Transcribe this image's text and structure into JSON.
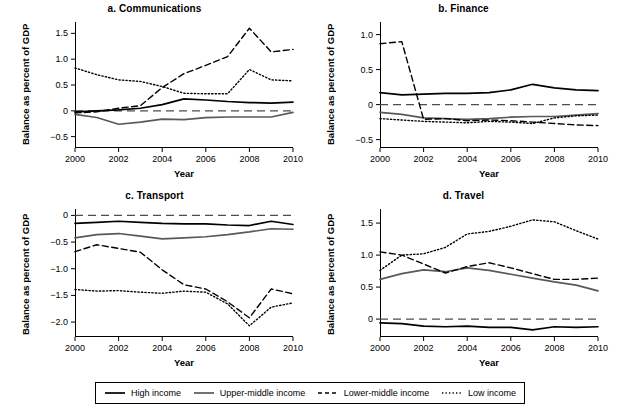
{
  "figure": {
    "axis_x_label": "Year",
    "axis_y_label": "Balance as percent of GDP"
  },
  "legend": {
    "items": [
      {
        "label": "High income",
        "style": "solid",
        "color": "#000000"
      },
      {
        "label": "Upper-middle income",
        "style": "solid",
        "color": "#595959"
      },
      {
        "label": "Lower-middle income",
        "style": "dashed",
        "color": "#000000"
      },
      {
        "label": "Low income",
        "style": "dotted",
        "color": "#000000"
      }
    ]
  },
  "chart_data": [
    {
      "type": "line",
      "title": "a. Communications",
      "xlabel": "Year",
      "ylabel": "Balance as percent of GDP",
      "x": [
        2000,
        2001,
        2002,
        2003,
        2004,
        2005,
        2006,
        2007,
        2008,
        2009,
        2010
      ],
      "xlim": [
        2000,
        2010
      ],
      "ylim": [
        -0.72,
        1.72
      ],
      "yticks": [
        1.5,
        1.0,
        0.5,
        0,
        -0.5
      ],
      "ytick_labels": [
        "1.5",
        "1.0",
        "0.5",
        "0",
        "−0.5"
      ],
      "xticks": [
        2000,
        2002,
        2004,
        2006,
        2008,
        2010
      ],
      "xtick_labels": [
        "2000",
        "2002",
        "2004",
        "2006",
        "2008",
        "2010"
      ],
      "zero_line": 0,
      "grid": false,
      "series": [
        {
          "name": "High income",
          "style": "solid",
          "color": "#000000",
          "values": [
            -0.02,
            0.0,
            0.02,
            0.05,
            0.12,
            0.23,
            0.21,
            0.18,
            0.16,
            0.15,
            0.17
          ]
        },
        {
          "name": "Upper-middle income",
          "style": "solid",
          "color": "#595959",
          "values": [
            -0.07,
            -0.13,
            -0.26,
            -0.22,
            -0.16,
            -0.17,
            -0.13,
            -0.12,
            -0.12,
            -0.12,
            -0.03
          ]
        },
        {
          "name": "Lower-middle income",
          "style": "dashed",
          "color": "#000000",
          "values": [
            -0.04,
            -0.02,
            0.05,
            0.1,
            0.45,
            0.72,
            0.88,
            1.05,
            1.6,
            1.14,
            1.19
          ]
        },
        {
          "name": "Low income",
          "style": "dotted",
          "color": "#000000",
          "values": [
            0.83,
            0.7,
            0.6,
            0.57,
            0.47,
            0.34,
            0.33,
            0.33,
            0.8,
            0.6,
            0.58
          ]
        }
      ]
    },
    {
      "type": "line",
      "title": "b. Finance",
      "xlabel": "Year",
      "ylabel": "Balance as percent of GDP",
      "x": [
        2000,
        2001,
        2002,
        2003,
        2004,
        2005,
        2006,
        2007,
        2008,
        2009,
        2010
      ],
      "xlim": [
        2000,
        2010
      ],
      "ylim": [
        -0.62,
        1.18
      ],
      "yticks": [
        1.0,
        0.5,
        0,
        -0.5
      ],
      "ytick_labels": [
        "1.0",
        "0.5",
        "0",
        "−0.5"
      ],
      "xticks": [
        2000,
        2002,
        2004,
        2006,
        2008,
        2010
      ],
      "xtick_labels": [
        "2000",
        "2002",
        "2004",
        "2006",
        "2008",
        "2010"
      ],
      "zero_line": 0,
      "grid": false,
      "series": [
        {
          "name": "High income",
          "style": "solid",
          "color": "#000000",
          "values": [
            0.17,
            0.14,
            0.15,
            0.16,
            0.16,
            0.17,
            0.21,
            0.29,
            0.24,
            0.21,
            0.2
          ]
        },
        {
          "name": "Upper-middle income",
          "style": "solid",
          "color": "#595959",
          "values": [
            -0.11,
            -0.14,
            -0.19,
            -0.2,
            -0.21,
            -0.2,
            -0.18,
            -0.17,
            -0.17,
            -0.15,
            -0.13
          ]
        },
        {
          "name": "Lower-middle income",
          "style": "dashed",
          "color": "#000000",
          "values": [
            0.87,
            0.9,
            -0.21,
            -0.2,
            -0.23,
            -0.22,
            -0.23,
            -0.25,
            -0.27,
            -0.29,
            -0.3
          ]
        },
        {
          "name": "Low income",
          "style": "dotted",
          "color": "#000000",
          "values": [
            -0.2,
            -0.22,
            -0.24,
            -0.25,
            -0.26,
            -0.24,
            -0.25,
            -0.27,
            -0.19,
            -0.16,
            -0.15
          ]
        }
      ]
    },
    {
      "type": "line",
      "title": "c. Transport",
      "xlabel": "Year",
      "ylabel": "Balance as percent of GDP",
      "x": [
        2000,
        2001,
        2002,
        2003,
        2004,
        2005,
        2006,
        2007,
        2008,
        2009,
        2010
      ],
      "xlim": [
        2000,
        2010
      ],
      "ylim": [
        -2.28,
        0.12
      ],
      "yticks": [
        0,
        -0.5,
        -1.0,
        -1.5,
        -2.0
      ],
      "ytick_labels": [
        "0",
        "−0.5",
        "−1.0",
        "−1.5",
        "−2.0"
      ],
      "xticks": [
        2000,
        2002,
        2004,
        2006,
        2008,
        2010
      ],
      "xtick_labels": [
        "2000",
        "2002",
        "2004",
        "2006",
        "2008",
        "2010"
      ],
      "zero_line": 0,
      "grid": false,
      "series": [
        {
          "name": "High income",
          "style": "solid",
          "color": "#000000",
          "values": [
            -0.15,
            -0.13,
            -0.11,
            -0.13,
            -0.15,
            -0.16,
            -0.16,
            -0.18,
            -0.19,
            -0.11,
            -0.17
          ]
        },
        {
          "name": "Upper-middle income",
          "style": "solid",
          "color": "#595959",
          "values": [
            -0.42,
            -0.36,
            -0.34,
            -0.39,
            -0.44,
            -0.42,
            -0.4,
            -0.36,
            -0.31,
            -0.25,
            -0.26
          ]
        },
        {
          "name": "Lower-middle income",
          "style": "dashed",
          "color": "#000000",
          "values": [
            -0.68,
            -0.55,
            -0.62,
            -0.69,
            -1.02,
            -1.3,
            -1.38,
            -1.62,
            -1.92,
            -1.38,
            -1.47
          ]
        },
        {
          "name": "Low income",
          "style": "dotted",
          "color": "#000000",
          "values": [
            -1.39,
            -1.42,
            -1.41,
            -1.44,
            -1.46,
            -1.42,
            -1.44,
            -1.66,
            -2.07,
            -1.72,
            -1.64
          ]
        }
      ]
    },
    {
      "type": "line",
      "title": "d. Travel",
      "xlabel": "Year",
      "ylabel": "Balance as percent of GDP",
      "x": [
        2000,
        2001,
        2002,
        2003,
        2004,
        2005,
        2006,
        2007,
        2008,
        2009,
        2010
      ],
      "xlim": [
        2000,
        2010
      ],
      "ylim": [
        -0.28,
        1.72
      ],
      "yticks": [
        1.5,
        1.0,
        0.5,
        0
      ],
      "ytick_labels": [
        "1.5",
        "1.0",
        "0.5",
        "0"
      ],
      "xticks": [
        2000,
        2002,
        2004,
        2006,
        2008,
        2010
      ],
      "xtick_labels": [
        "2000",
        "2002",
        "2004",
        "2006",
        "2008",
        "2010"
      ],
      "zero_line": 0,
      "grid": false,
      "series": [
        {
          "name": "High income",
          "style": "solid",
          "color": "#000000",
          "values": [
            -0.06,
            -0.07,
            -0.11,
            -0.12,
            -0.11,
            -0.13,
            -0.13,
            -0.17,
            -0.12,
            -0.13,
            -0.12
          ]
        },
        {
          "name": "Upper-middle income",
          "style": "solid",
          "color": "#595959",
          "values": [
            0.62,
            0.71,
            0.77,
            0.74,
            0.8,
            0.76,
            0.7,
            0.64,
            0.58,
            0.53,
            0.44
          ]
        },
        {
          "name": "Lower-middle income",
          "style": "dashed",
          "color": "#000000",
          "values": [
            1.05,
            1.0,
            0.86,
            0.72,
            0.82,
            0.88,
            0.8,
            0.71,
            0.62,
            0.62,
            0.64
          ]
        },
        {
          "name": "Low income",
          "style": "dotted",
          "color": "#000000",
          "values": [
            0.76,
            1.0,
            1.02,
            1.12,
            1.33,
            1.37,
            1.45,
            1.55,
            1.52,
            1.38,
            1.25
          ]
        }
      ]
    }
  ]
}
